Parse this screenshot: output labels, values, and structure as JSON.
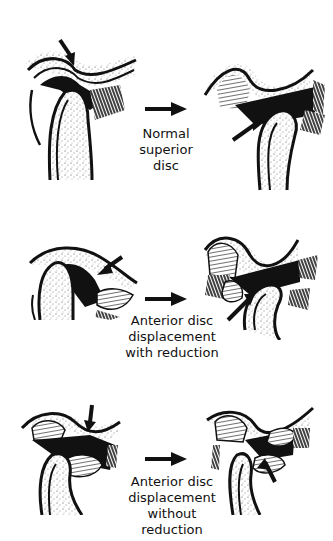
{
  "figure": {
    "rows": [
      {
        "id": "normal",
        "caption_lines": [
          "Normal",
          "superior",
          "disc"
        ],
        "left_view": "closed-mouth",
        "right_view": "open-mouth"
      },
      {
        "id": "add-with-reduction",
        "caption_lines": [
          "Anterior disc",
          "displacement",
          "with reduction"
        ],
        "left_view": "closed-mouth",
        "right_view": "open-mouth"
      },
      {
        "id": "add-without-reduction",
        "caption_lines": [
          "Anterior disc",
          "displacement",
          "without",
          "reduction"
        ],
        "left_view": "closed-mouth",
        "right_view": "open-mouth"
      }
    ],
    "colors": {
      "ink": "#111111",
      "background": "#ffffff",
      "stipple": "#555555"
    }
  }
}
